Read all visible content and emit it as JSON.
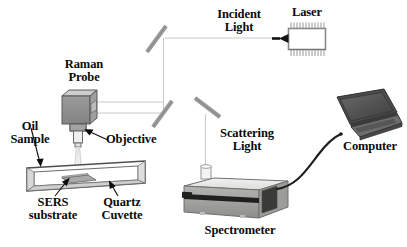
{
  "figure": {
    "type": "schematic-diagram",
    "background_color": "#ffffff",
    "line_color": "#111111",
    "beam_color": "#c8c8c8",
    "body_gray": "#8d8d8d",
    "light_gray": "#d9d9d9",
    "dark_gray": "#4a4a4a"
  },
  "labels": {
    "incident_light": "Incident\nLight",
    "laser": "Laser",
    "raman_probe": "Raman\nProbe",
    "objective": "Objective",
    "oil_sample": "Oil\nSample",
    "sers_substrate": "SERS\nsubstrate",
    "quartz_cuvette": "Quartz\nCuvette",
    "scattering_light": "Scattering\nLight",
    "spectrometer": "Spectrometer",
    "computer": "Computer"
  },
  "components": [
    {
      "name": "laser",
      "label": "Laser",
      "shape": "finned-box"
    },
    {
      "name": "mirror-1",
      "label": "",
      "shape": "diagonal-bar"
    },
    {
      "name": "mirror-2",
      "label": "",
      "shape": "diagonal-bar"
    },
    {
      "name": "mirror-3",
      "label": "",
      "shape": "diagonal-bar"
    },
    {
      "name": "raman-probe",
      "label": "Raman Probe",
      "shape": "iso-box"
    },
    {
      "name": "objective",
      "label": "Objective",
      "shape": "cylinder"
    },
    {
      "name": "quartz-cuvette",
      "label": "Quartz Cuvette",
      "shape": "flat-plate"
    },
    {
      "name": "sers-substrate",
      "label": "SERS substrate",
      "shape": "parallelogram"
    },
    {
      "name": "spectrometer",
      "label": "Spectrometer",
      "shape": "iso-box"
    },
    {
      "name": "computer",
      "label": "Computer",
      "shape": "laptop"
    }
  ],
  "beam_paths": [
    {
      "name": "incident-beam",
      "from": "laser",
      "to": "mirror-1",
      "direction": "right-to-left"
    },
    {
      "name": "incident-beam-down",
      "from": "mirror-1",
      "to": "mirror-2",
      "direction": "downward"
    },
    {
      "name": "probe-beam",
      "from": "mirror-2",
      "to": "raman-probe",
      "direction": "right-to-left"
    },
    {
      "name": "excitation-cone",
      "from": "objective",
      "to": "quartz-cuvette",
      "direction": "downward"
    },
    {
      "name": "scattering-beam",
      "from": "mirror-3",
      "to": "spectrometer",
      "direction": "downward"
    },
    {
      "name": "data-cable",
      "from": "spectrometer",
      "to": "computer",
      "direction": "right"
    }
  ]
}
